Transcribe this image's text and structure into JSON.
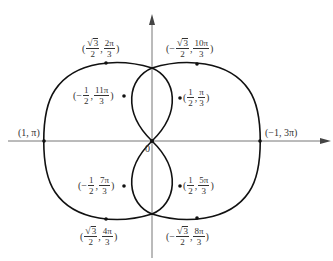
{
  "diagram": {
    "type": "polar-curve",
    "origin_label": "0",
    "axes": {
      "horizontal": {
        "arrow": "right"
      },
      "vertical": {
        "arrow": "up"
      }
    },
    "points": [
      {
        "id": "p1",
        "label_plain": "(1, π)",
        "r": "1",
        "theta": "π"
      },
      {
        "id": "p2",
        "label_plain": "(−1, 3π)",
        "r": "−1",
        "theta": "3π"
      },
      {
        "id": "p3",
        "open": "(",
        "r_sign": "",
        "r_num": "3",
        "r_sqrt": true,
        "r_den": "2",
        "theta_num": "2π",
        "theta_den": "3",
        "close": ")"
      },
      {
        "id": "p4",
        "open": "(",
        "r_sign": "−",
        "r_num": "3",
        "r_sqrt": true,
        "r_den": "2",
        "theta_num": "10π",
        "theta_den": "3",
        "close": ")"
      },
      {
        "id": "p5",
        "open": "(",
        "r_sign": "−",
        "r_num": "1",
        "r_sqrt": false,
        "r_den": "2",
        "theta_num": "11π",
        "theta_den": "3",
        "close": ")"
      },
      {
        "id": "p6",
        "open": "(",
        "r_sign": "",
        "r_num": "1",
        "r_sqrt": false,
        "r_den": "2",
        "theta_num": "π",
        "theta_den": "3",
        "close": ")"
      },
      {
        "id": "p7",
        "open": "(",
        "r_sign": "−",
        "r_num": "1",
        "r_sqrt": false,
        "r_den": "2",
        "theta_num": "7π",
        "theta_den": "3",
        "close": ")"
      },
      {
        "id": "p8",
        "open": "(",
        "r_sign": "",
        "r_num": "1",
        "r_sqrt": false,
        "r_den": "2",
        "theta_num": "5π",
        "theta_den": "3",
        "close": ")"
      },
      {
        "id": "p9",
        "open": "(",
        "r_sign": "",
        "r_num": "3",
        "r_sqrt": true,
        "r_den": "2",
        "theta_num": "4π",
        "theta_den": "3",
        "close": ")"
      },
      {
        "id": "p10",
        "open": "(",
        "r_sign": "−",
        "r_num": "3",
        "r_sqrt": true,
        "r_den": "2",
        "theta_num": "8π",
        "theta_den": "3",
        "close": ")"
      }
    ],
    "colors": {
      "curve": "#111111",
      "axis": "#777777",
      "text": "#333333"
    }
  }
}
